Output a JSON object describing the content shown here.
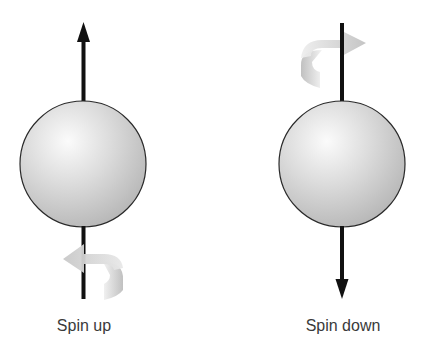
{
  "diagram": {
    "panels": [
      {
        "id": "spin-up",
        "label": "Spin up",
        "arrow_direction": "up",
        "rotation_arrow_position": "bottom",
        "rotation_arrow_direction": "left"
      },
      {
        "id": "spin-down",
        "label": "Spin down",
        "arrow_direction": "down",
        "rotation_arrow_position": "top",
        "rotation_arrow_direction": "right"
      }
    ],
    "colors": {
      "sphere_light": "#f6f6f6",
      "sphere_dark": "#b8b8b8",
      "outline": "#2a2a2a",
      "arrow": "#111111",
      "rotation_arrow": "#c4c4c4",
      "text": "#3a3a3a"
    }
  }
}
